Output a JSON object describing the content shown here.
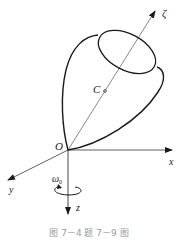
{
  "figure": {
    "axes": {
      "x": "x",
      "y": "y",
      "z": "z",
      "zeta": "ζ"
    },
    "origin_label": "O",
    "center_of_mass_label": "C",
    "angular_velocity_label": "ω",
    "angular_velocity_subscript": "0",
    "caption": "图 7－4    题 7－9 图"
  },
  "colors": {
    "stroke": "#1a1a1a",
    "caption": "#9a9a9a"
  }
}
